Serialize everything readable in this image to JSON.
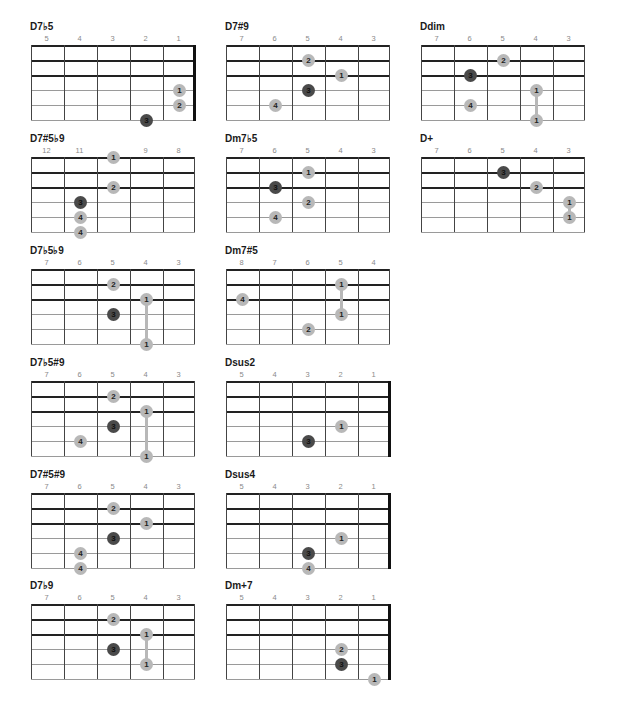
{
  "colors": {
    "finger_dot": "#b8b8b8",
    "root_dot": "#4a4a4a",
    "grid_line": "#222222",
    "fret_label": "#8a8a8a"
  },
  "chords": [
    {
      "name": "D7♭5",
      "x": 30,
      "y": 21,
      "frets": [
        "5",
        "4",
        "3",
        "2",
        "1"
      ],
      "nut": true,
      "dots": [
        {
          "f": "1",
          "c": 4,
          "s": 3
        },
        {
          "f": "2",
          "c": 4,
          "s": 4
        },
        {
          "f": "3",
          "c": 3,
          "s": 5,
          "root": true
        }
      ],
      "barres": []
    },
    {
      "name": "D7#9",
      "x": 225,
      "y": 21,
      "frets": [
        "7",
        "6",
        "5",
        "4",
        "3"
      ],
      "nut": false,
      "dots": [
        {
          "f": "2",
          "c": 2,
          "s": 1
        },
        {
          "f": "1",
          "c": 3,
          "s": 2
        },
        {
          "f": "3",
          "c": 2,
          "s": 3,
          "root": true
        },
        {
          "f": "4",
          "c": 1,
          "s": 4
        }
      ],
      "barres": []
    },
    {
      "name": "Ddim",
      "x": 420,
      "y": 21,
      "frets": [
        "7",
        "6",
        "5",
        "4",
        "3"
      ],
      "nut": false,
      "dots": [
        {
          "f": "2",
          "c": 2,
          "s": 1
        },
        {
          "f": "3",
          "c": 1,
          "s": 2,
          "root": true
        },
        {
          "f": "1",
          "c": 3,
          "s": 3
        },
        {
          "f": "4",
          "c": 1,
          "s": 4
        },
        {
          "f": "1",
          "c": 3,
          "s": 5
        }
      ],
      "barres": [
        {
          "c": 3,
          "from": 3,
          "to": 5
        }
      ]
    },
    {
      "name": "D7#5♭9",
      "x": 30,
      "y": 133,
      "frets": [
        "12",
        "11",
        "",
        "9",
        "8"
      ],
      "nut": false,
      "dots": [
        {
          "f": "1",
          "c": 2,
          "s": 0
        },
        {
          "f": "2",
          "c": 2,
          "s": 2
        },
        {
          "f": "3",
          "c": 1,
          "s": 3,
          "root": true
        },
        {
          "f": "4",
          "c": 1,
          "s": 4
        },
        {
          "f": "4",
          "c": 1,
          "s": 5
        }
      ],
      "barres": []
    },
    {
      "name": "Dm7♭5",
      "x": 225,
      "y": 133,
      "frets": [
        "7",
        "6",
        "5",
        "4",
        "3"
      ],
      "nut": false,
      "dots": [
        {
          "f": "1",
          "c": 2,
          "s": 1
        },
        {
          "f": "3",
          "c": 1,
          "s": 2,
          "root": true
        },
        {
          "f": "2",
          "c": 2,
          "s": 3
        },
        {
          "f": "4",
          "c": 1,
          "s": 4
        }
      ],
      "barres": []
    },
    {
      "name": "D+",
      "x": 420,
      "y": 133,
      "frets": [
        "7",
        "6",
        "5",
        "4",
        "3"
      ],
      "nut": false,
      "dots": [
        {
          "f": "3",
          "c": 2,
          "s": 1,
          "root": true
        },
        {
          "f": "2",
          "c": 3,
          "s": 2
        },
        {
          "f": "1",
          "c": 4,
          "s": 3
        },
        {
          "f": "1",
          "c": 4,
          "s": 4
        }
      ],
      "barres": [
        {
          "c": 4,
          "from": 3,
          "to": 4
        }
      ]
    },
    {
      "name": "D7♭5♭9",
      "x": 30,
      "y": 245,
      "frets": [
        "7",
        "6",
        "5",
        "4",
        "3"
      ],
      "nut": false,
      "dots": [
        {
          "f": "2",
          "c": 2,
          "s": 1
        },
        {
          "f": "1",
          "c": 3,
          "s": 2
        },
        {
          "f": "3",
          "c": 2,
          "s": 3,
          "root": true
        },
        {
          "f": "1",
          "c": 3,
          "s": 5
        }
      ],
      "barres": [
        {
          "c": 3,
          "from": 2,
          "to": 5
        }
      ]
    },
    {
      "name": "Dm7#5",
      "x": 225,
      "y": 245,
      "frets": [
        "8",
        "7",
        "6",
        "5",
        "4"
      ],
      "nut": false,
      "dots": [
        {
          "f": "1",
          "c": 3,
          "s": 1
        },
        {
          "f": "4",
          "c": 0,
          "s": 2
        },
        {
          "f": "1",
          "c": 3,
          "s": 3
        },
        {
          "f": "2",
          "c": 2,
          "s": 4
        }
      ],
      "barres": [
        {
          "c": 3,
          "from": 1,
          "to": 3
        }
      ]
    },
    {
      "name": "D7♭5#9",
      "x": 30,
      "y": 357,
      "frets": [
        "7",
        "6",
        "5",
        "4",
        "3"
      ],
      "nut": false,
      "dots": [
        {
          "f": "2",
          "c": 2,
          "s": 1
        },
        {
          "f": "1",
          "c": 3,
          "s": 2
        },
        {
          "f": "3",
          "c": 2,
          "s": 3,
          "root": true
        },
        {
          "f": "4",
          "c": 1,
          "s": 4
        },
        {
          "f": "1",
          "c": 3,
          "s": 5
        }
      ],
      "barres": [
        {
          "c": 3,
          "from": 2,
          "to": 5
        }
      ]
    },
    {
      "name": "Dsus2",
      "x": 225,
      "y": 357,
      "frets": [
        "5",
        "4",
        "3",
        "2",
        "1"
      ],
      "nut": true,
      "dots": [
        {
          "f": "1",
          "c": 3,
          "s": 3
        },
        {
          "f": "3",
          "c": 2,
          "s": 4,
          "root": true
        }
      ],
      "barres": []
    },
    {
      "name": "D7#5#9",
      "x": 30,
      "y": 469,
      "frets": [
        "7",
        "6",
        "5",
        "4",
        "3"
      ],
      "nut": false,
      "dots": [
        {
          "f": "2",
          "c": 2,
          "s": 1
        },
        {
          "f": "1",
          "c": 3,
          "s": 2
        },
        {
          "f": "3",
          "c": 2,
          "s": 3,
          "root": true
        },
        {
          "f": "4",
          "c": 1,
          "s": 4
        },
        {
          "f": "4",
          "c": 1,
          "s": 5
        }
      ],
      "barres": []
    },
    {
      "name": "Dsus4",
      "x": 225,
      "y": 469,
      "frets": [
        "5",
        "4",
        "3",
        "2",
        "1"
      ],
      "nut": true,
      "dots": [
        {
          "f": "1",
          "c": 3,
          "s": 3
        },
        {
          "f": "3",
          "c": 2,
          "s": 4,
          "root": true
        },
        {
          "f": "4",
          "c": 2,
          "s": 5
        }
      ],
      "barres": []
    },
    {
      "name": "D7♭9",
      "x": 30,
      "y": 580,
      "frets": [
        "7",
        "6",
        "5",
        "4",
        "3"
      ],
      "nut": false,
      "dots": [
        {
          "f": "2",
          "c": 2,
          "s": 1
        },
        {
          "f": "1",
          "c": 3,
          "s": 2
        },
        {
          "f": "3",
          "c": 2,
          "s": 3,
          "root": true
        },
        {
          "f": "1",
          "c": 3,
          "s": 4
        }
      ],
      "barres": [
        {
          "c": 3,
          "from": 2,
          "to": 4
        }
      ]
    },
    {
      "name": "Dm+7",
      "x": 225,
      "y": 580,
      "frets": [
        "5",
        "4",
        "3",
        "2",
        "1"
      ],
      "nut": true,
      "dots": [
        {
          "f": "2",
          "c": 3,
          "s": 3
        },
        {
          "f": "3",
          "c": 3,
          "s": 4,
          "root": true
        },
        {
          "f": "1",
          "c": 4,
          "s": 5
        }
      ],
      "barres": []
    }
  ]
}
